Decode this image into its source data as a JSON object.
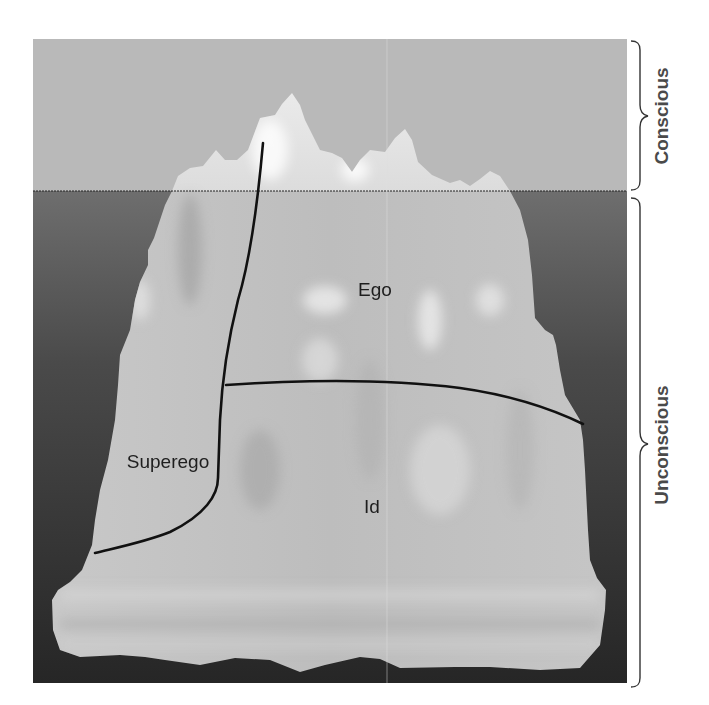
{
  "diagram": {
    "levels": [
      {
        "id": "conscious",
        "label": "Conscious"
      },
      {
        "id": "unconscious",
        "label": "Unconscious"
      }
    ],
    "regions": [
      {
        "id": "ego",
        "label": "Ego"
      },
      {
        "id": "superego",
        "label": "Superego"
      },
      {
        "id": "id",
        "label": "Id"
      }
    ],
    "colors": {
      "sky": "#b9b9b9",
      "water_top": "#6e6e6e",
      "water_bottom": "#2a2a2a",
      "ice_light": "#e6e6e6",
      "ice_mid": "#c4c4c4",
      "division_line": "#111111",
      "side_label": "#4a4a4a"
    }
  }
}
